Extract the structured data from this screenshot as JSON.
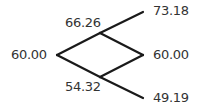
{
  "tree": {
    "type": "binomial-tree",
    "steps": 2,
    "root": "60.00",
    "step1": {
      "up": "66.26",
      "down": "54.32"
    },
    "step2": {
      "up_up": "73.18",
      "up_down": "60.00",
      "down_down": "49.19"
    }
  },
  "colors": {
    "line": "#1a1a1a",
    "text": "#333333"
  }
}
